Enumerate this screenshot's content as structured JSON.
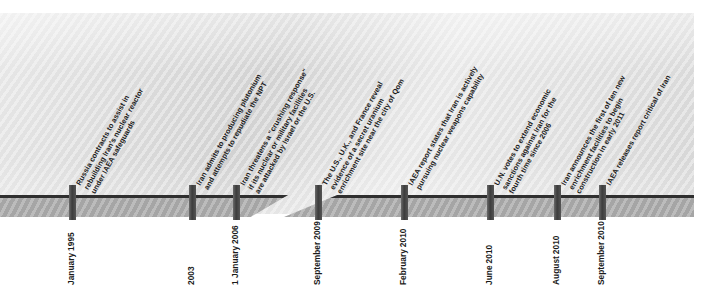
{
  "graphic": {
    "kind": "timeline",
    "title_visible": false,
    "colors": {
      "panel_background": "#d2d2d2",
      "axis_bar": "#a9a9a9",
      "axis_top_edge": "#2f2f2f",
      "tick": "#4a4a4a",
      "text": "#1b1b1b",
      "page_background": "#ffffff"
    },
    "axis": {
      "has_break": true,
      "break_note": "diagonal break between 1 January 2006 and September 2009"
    }
  },
  "events": [
    {
      "id": "event-1",
      "x": 72,
      "text": "Russia contracts to assist in rebuilding Iran's nuclear reactor under IAEA safeguards",
      "lines": [
        "Russia contracts to assist in",
        "rebuilding Iran's nuclear reactor",
        "under IAEA safeguards"
      ],
      "date_lines": [
        "January",
        "1995"
      ],
      "date": "January 1995"
    },
    {
      "id": "event-2",
      "x": 192,
      "text": "Iran admits to producing plutonium and attempts to repudiate the NPT",
      "lines": [
        "Iran admits to producing plutonium",
        "and attempts to repudiate the NPT"
      ],
      "date_lines": [
        "2003"
      ],
      "date": "2003"
    },
    {
      "id": "event-3",
      "x": 236,
      "text": "Iran threatens a \"crushing response\" if its nuclear or military facilities are attacked by Israel or the U.S.",
      "lines": [
        "Iran threatens a \"crushing response\"",
        "if its nuclear or military facilities",
        "are attacked by Israel or the U.S."
      ],
      "date_lines": [
        "1 January",
        "2006"
      ],
      "date": "1 January 2006"
    },
    {
      "id": "event-4",
      "x": 318,
      "text": "The U.S., U.K., and France reveal evidence of a secret uranium enrichment site near the city of Qom",
      "lines": [
        "The U.S., U.K., and France reveal",
        "evidence of a secret uranium",
        "enrichment site near the city of Qom"
      ],
      "date_lines": [
        "September",
        "2009"
      ],
      "date": "September 2009"
    },
    {
      "id": "event-5",
      "x": 404,
      "text": "IAEA report states that Iran is actively pursuing nuclear weapons capability",
      "lines": [
        "IAEA report states that Iran is actively",
        "pursuing nuclear weapons capability"
      ],
      "date_lines": [
        "February",
        "2010"
      ],
      "date": "February 2010"
    },
    {
      "id": "event-6",
      "x": 490,
      "text": "U.N. votes to extend economic sanctions against Iran for the fourth time since 2006",
      "lines": [
        "U.N. votes to extend economic",
        "sanctions against Iran for the",
        "fourth time since 2006"
      ],
      "date_lines": [
        "June",
        "2010"
      ],
      "date": "June 2010"
    },
    {
      "id": "event-7",
      "x": 557,
      "text": "Iran announces the first of ten new enrichment facilities to begin construction in early 2011",
      "lines": [
        "Iran announces the first of ten new",
        "enrichment facilities to begin",
        "construction in early 2011"
      ],
      "date_lines": [
        "August",
        "2010"
      ],
      "date": "August 2010"
    },
    {
      "id": "event-8",
      "x": 602,
      "text": "IAEA releases report critical of Iran",
      "lines": [
        "IAEA releases report critical of Iran"
      ],
      "date_lines": [
        "September",
        "2010"
      ],
      "date": "September 2010"
    }
  ]
}
